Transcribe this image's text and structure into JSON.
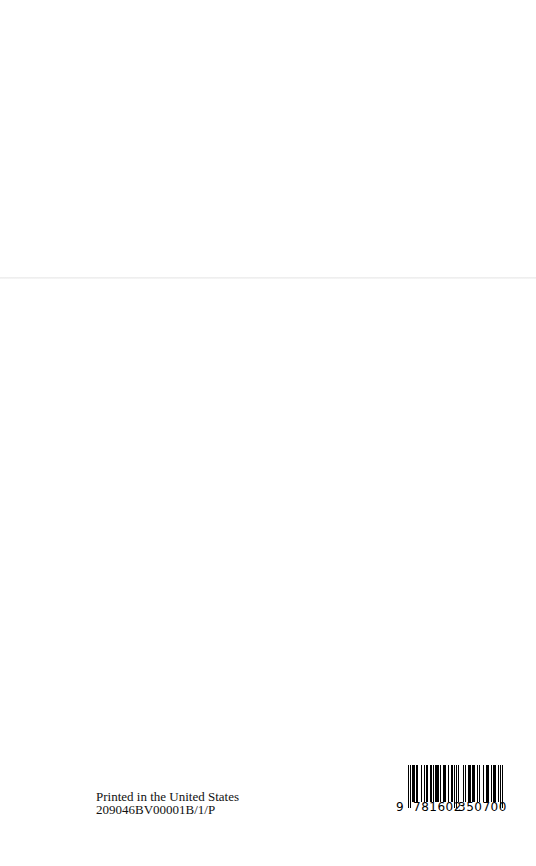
{
  "imprint": {
    "line1": "Printed in the United States",
    "line2": "209046BV00001B/1/P"
  },
  "barcode": {
    "lead_digit": "9",
    "left_group": "781602",
    "right_group": "350700",
    "full": "9781602350700"
  }
}
